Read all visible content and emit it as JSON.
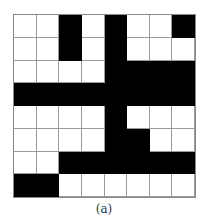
{
  "figure": {
    "caption": "(a)",
    "rows": 8,
    "cols": 8,
    "fill_color": "#000000",
    "empty_color": "#ffffff",
    "grid": [
      [
        0,
        0,
        1,
        0,
        1,
        0,
        0,
        1
      ],
      [
        0,
        0,
        1,
        0,
        1,
        0,
        0,
        0
      ],
      [
        0,
        0,
        0,
        0,
        1,
        1,
        1,
        1
      ],
      [
        1,
        1,
        1,
        1,
        1,
        1,
        1,
        1
      ],
      [
        0,
        0,
        0,
        0,
        1,
        0,
        0,
        0
      ],
      [
        0,
        0,
        0,
        0,
        1,
        1,
        0,
        0
      ],
      [
        0,
        0,
        1,
        1,
        1,
        1,
        1,
        1
      ],
      [
        1,
        1,
        0,
        0,
        0,
        0,
        0,
        0
      ]
    ]
  }
}
